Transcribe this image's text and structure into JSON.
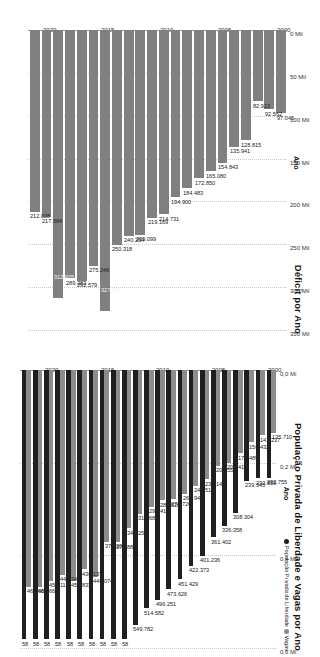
{
  "chart_data": [
    {
      "type": "bar",
      "title": "Déficit por Ano",
      "xlabel": "Ano",
      "ylabel": "Déficit",
      "ylim": [
        0,
        350000
      ],
      "grid": true,
      "orientation": "vertical-rotated",
      "tick_labels": [
        "0 Mil",
        "50 Mil",
        "100 Mil",
        "150 Mil",
        "200 Mil",
        "250 Mil",
        "300 Mil",
        "350 Mil"
      ],
      "tick_values": [
        0,
        50000,
        100000,
        150000,
        200000,
        250000,
        300000,
        350000
      ],
      "year_ticks": [
        "2000",
        "2005",
        "2010",
        "2015",
        "2020"
      ],
      "bar_color": "#808080",
      "categories": [
        "2000",
        "2001",
        "2002",
        "2003",
        "2004",
        "2005",
        "2006",
        "2007",
        "2008",
        "2009",
        "2010",
        "2011",
        "2012",
        "2013",
        "2014",
        "2015",
        "2016",
        "2017",
        "2018",
        "2019",
        "2020",
        "2021"
      ],
      "values": [
        97045,
        92562,
        82913,
        128815,
        135941,
        154843,
        165080,
        172850,
        184483,
        194900,
        214731,
        219169,
        239099,
        240254,
        250318,
        327417,
        275246,
        292579,
        289383,
        312925,
        217584,
        212008
      ],
      "data_labels": [
        "97.045",
        "92.562",
        "82.913",
        "128.815",
        "135.941",
        "154.843",
        "165.080",
        "172.850",
        "184.483",
        "194.900",
        "214.731",
        "219.169",
        "239.099",
        "240.254",
        "250.318",
        "327.417",
        "275.246",
        "292.579",
        "289.383",
        "312.925",
        "217.584",
        "212.008"
      ]
    },
    {
      "type": "bar",
      "title": "População Privada de Liberdade e Vagas por Ano",
      "xlabel": "Ano",
      "ylabel": "População Privada de Liberdade e Vagas",
      "ylim": [
        0,
        600000
      ],
      "grid": true,
      "orientation": "vertical-rotated",
      "tick_labels": [
        "0,0 Mi",
        "0,2 Mi",
        "0,4 Mi",
        "0,6 Mi"
      ],
      "tick_values": [
        0,
        200000,
        400000,
        600000
      ],
      "year_ticks": [
        "2000",
        "2005",
        "2010",
        "2015",
        "2020"
      ],
      "legend": [
        {
          "name": "População Privada de Liberdade",
          "color": "#1f1f1f"
        },
        {
          "name": "Vagas",
          "color": "#8c8c8c"
        }
      ],
      "legend_position": "top-right",
      "categories": [
        "2000",
        "2001",
        "2002",
        "2003",
        "2004",
        "2005",
        "2006",
        "2007",
        "2008",
        "2009",
        "2010",
        "2011",
        "2012",
        "2013",
        "2014",
        "2015",
        "2016",
        "2017",
        "2018",
        "2019",
        "2020",
        "2021",
        "2022"
      ],
      "series": [
        {
          "name": "Vagas",
          "color": "#8c8c8c",
          "values": [
            135710,
            141237,
            156432,
            179489,
            200417,
            206559,
            236148,
            249515,
            266946,
            278726,
            281520,
            295413,
            310687,
            341253,
            371884,
            371201,
            446074,
            430137,
            454833,
            442349,
            455113,
            467669,
            467669
          ],
          "data_labels": [
            "135.710",
            "141.237",
            "156.432",
            "179.489",
            "200.417",
            "206.559",
            "236.148",
            "249.515",
            "266.946",
            "278.726",
            "281.520",
            "295.413",
            "310.687",
            "341.253",
            "371.884",
            "371.201",
            "446.074",
            "430.137",
            "454.833",
            "442.349",
            "455.113",
            "467.669",
            "467.669"
          ]
        },
        {
          "name": "População Privada de Liberdade",
          "color": "#1f1f1f",
          "values": [
            232755,
            233859,
            239345,
            308304,
            336358,
            361402,
            401236,
            422373,
            451429,
            473626,
            496251,
            514582,
            549782,
            581000,
            581000,
            581000,
            581000,
            581000,
            581000,
            581000,
            581000,
            581000,
            581000
          ],
          "data_labels": [
            "232.755",
            "233.859",
            "239.345",
            "308.304",
            "336.358",
            "361.402",
            "401.236",
            "422.373",
            "451.429",
            "473.626",
            "496.251",
            "514.582",
            "549.782",
            "58",
            "58",
            "58",
            "58",
            "58",
            "58",
            "58",
            "58",
            "58",
            "58"
          ]
        }
      ]
    }
  ]
}
